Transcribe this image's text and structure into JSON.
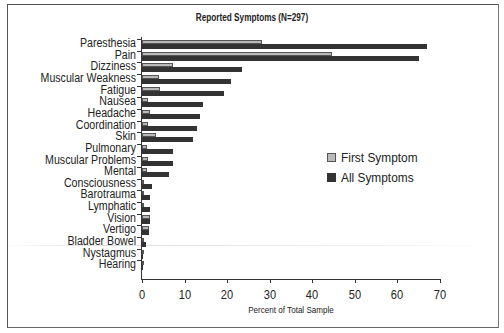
{
  "chart_data": {
    "type": "bar",
    "orientation": "horizontal",
    "title": "Reported Symptoms (N=297)",
    "xlabel": "Percent of Total Sample",
    "ylabel": "",
    "xlim": [
      0,
      70
    ],
    "xticks": [
      0,
      10,
      20,
      30,
      40,
      50,
      60,
      70
    ],
    "grid": false,
    "legend_position": "right-middle",
    "categories": [
      "Paresthesia",
      "Pain",
      "Dizziness",
      "Muscular Weakness",
      "Fatigue",
      "Nausea",
      "Headache",
      "Coordination",
      "Skin",
      "Pulmonary",
      "Muscular Problems",
      "Mental",
      "Consciousness",
      "Barotrauma",
      "Lymphatic",
      "Vision",
      "Vertigo",
      "Bladder Bowel",
      "Nystagmus",
      "Hearing"
    ],
    "series": [
      {
        "name": "First Symptom",
        "color": "#b9b9b9",
        "values": [
          28.2,
          44.6,
          7.3,
          4.0,
          4.2,
          1.4,
          1.9,
          1.4,
          3.3,
          1.1,
          1.4,
          1.2,
          0.3,
          0.3,
          0.3,
          1.9,
          1.6,
          0.0,
          0.0,
          0.0
        ]
      },
      {
        "name": "All Symptoms",
        "color": "#333333",
        "values": [
          67.0,
          65.1,
          23.5,
          20.9,
          19.3,
          14.3,
          13.6,
          12.9,
          12.0,
          7.3,
          7.3,
          6.3,
          2.3,
          1.9,
          1.9,
          1.9,
          1.6,
          0.9,
          0.3,
          0.3
        ]
      }
    ]
  },
  "legend": {
    "first_label": "First Symptom",
    "all_label": "All Symptoms"
  }
}
